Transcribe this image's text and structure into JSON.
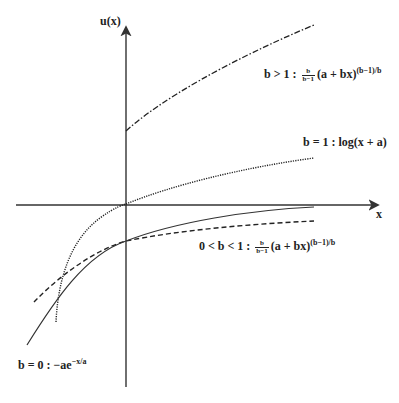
{
  "axes": {
    "y_label": "u(x)",
    "x_label": "x"
  },
  "curves": [
    {
      "id": "b-gt-1",
      "style": "dash-dot",
      "condition": "b > 1",
      "sep": ":",
      "frac_num": "b",
      "frac_den": "b−1",
      "expr": "(a + bx)",
      "exp": "(b−1)/b"
    },
    {
      "id": "b-eq-1",
      "style": "dotted",
      "condition": "b = 1",
      "sep": ":",
      "expr": "log(x + a)"
    },
    {
      "id": "b-between",
      "style": "dashed",
      "condition": "0 < b < 1",
      "sep": ":",
      "frac_num": "b",
      "frac_den": "b−1",
      "expr": "(a + bx)",
      "exp": "(b−1)/b"
    },
    {
      "id": "b-eq-0",
      "style": "solid",
      "condition": "b = 0",
      "sep": ":",
      "expr": "−ae",
      "exp": "−x/a"
    }
  ]
}
